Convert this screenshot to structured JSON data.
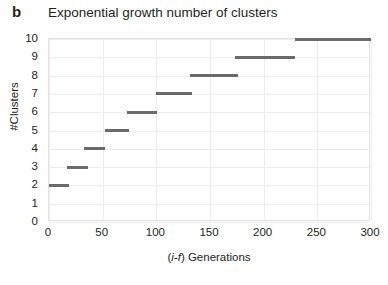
{
  "panel": {
    "label": "b"
  },
  "chart_data": {
    "type": "line",
    "subtype": "step",
    "title": "Exponential growth number of clusters",
    "xlabel": "(i-f) Generations",
    "xlabel_italic_part": "i-f",
    "xlabel_plain_part": ") Generations",
    "xlabel_open_paren": "(",
    "ylabel": "#Clusters",
    "xlim": [
      0,
      300
    ],
    "ylim": [
      0,
      10
    ],
    "xticks": [
      0,
      50,
      100,
      150,
      200,
      250,
      300
    ],
    "xtick_labels": [
      "0",
      "50",
      "100",
      "150",
      "200",
      "250",
      "300"
    ],
    "yticks": [
      0,
      1,
      2,
      3,
      4,
      5,
      6,
      7,
      8,
      9,
      10
    ],
    "ytick_labels": [
      "0",
      "1",
      "2",
      "3",
      "4",
      "5",
      "6",
      "7",
      "8",
      "9",
      "10"
    ],
    "grid": true,
    "legend": "none",
    "series_color": "#6a6a6a",
    "grid_color": "#ededed",
    "series": [
      {
        "name": "Number of clusters",
        "steps": [
          {
            "clusters": 2,
            "x_start": 0,
            "x_end": 19
          },
          {
            "clusters": 3,
            "x_start": 17,
            "x_end": 36
          },
          {
            "clusters": 4,
            "x_start": 33,
            "x_end": 52
          },
          {
            "clusters": 5,
            "x_start": 52,
            "x_end": 75
          },
          {
            "clusters": 6,
            "x_start": 73,
            "x_end": 101
          },
          {
            "clusters": 7,
            "x_start": 100,
            "x_end": 133
          },
          {
            "clusters": 8,
            "x_start": 131,
            "x_end": 176
          },
          {
            "clusters": 9,
            "x_start": 173,
            "x_end": 229
          },
          {
            "clusters": 10,
            "x_start": 229,
            "x_end": 300
          }
        ]
      }
    ]
  }
}
